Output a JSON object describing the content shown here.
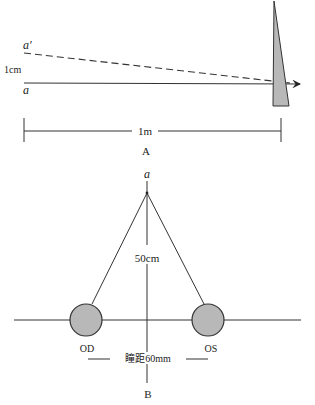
{
  "panel_a": {
    "label": "A",
    "point_a": "a",
    "point_a_prime": "a′",
    "displacement": "1cm",
    "distance": "1m",
    "prism_color": "#b8b8b8"
  },
  "panel_b": {
    "label": "B",
    "fixation_point": "a",
    "fixation_distance": "50cm",
    "right_eye": "OD",
    "left_eye": "OS",
    "pupillary_distance": "瞳距60mm",
    "eye_color": "#b8b8b8"
  }
}
